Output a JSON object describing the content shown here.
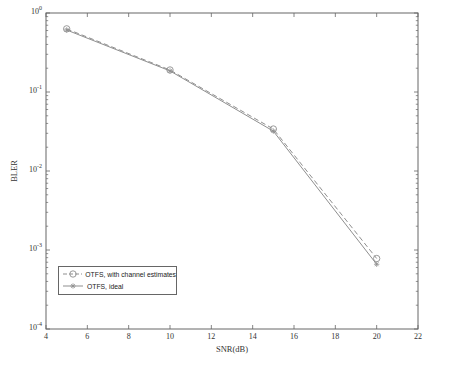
{
  "chart_data": {
    "type": "line",
    "xlabel": "SNR(dB)",
    "ylabel": "BLER",
    "x_axis": {
      "min": 4,
      "max": 22,
      "ticks": [
        4,
        6,
        8,
        10,
        12,
        14,
        16,
        18,
        20,
        22
      ]
    },
    "y_axis": {
      "scale": "log",
      "min": 0.0001,
      "max": 1,
      "tick_labels": [
        "10^0",
        "10^-1",
        "10^-2",
        "10^-3",
        "10^-4"
      ]
    },
    "grid": false,
    "legend": {
      "position": "inside-bottom-left",
      "border": true
    },
    "series": [
      {
        "name": "OTFS, with channel estimates",
        "marker": "circle",
        "line_style": "dashed",
        "color": "#8f8f8f",
        "x": [
          5,
          10,
          15,
          20
        ],
        "y": [
          0.63,
          0.19,
          0.034,
          0.00078
        ]
      },
      {
        "name": "OTFS, ideal",
        "marker": "asterisk",
        "line_style": "solid",
        "color": "#8f8f8f",
        "x": [
          5,
          10,
          15,
          20
        ],
        "y": [
          0.61,
          0.185,
          0.032,
          0.00066
        ]
      }
    ],
    "colors": {
      "frame": "#666666",
      "tick": "#666666",
      "text": "#333333"
    }
  }
}
